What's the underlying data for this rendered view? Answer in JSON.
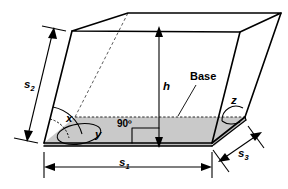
{
  "figure": {
    "labels": {
      "s1": {
        "text": "s",
        "sub": "1",
        "name": "base-length-label"
      },
      "s2": {
        "text": "s",
        "sub": "2",
        "name": "lateral-edge-label"
      },
      "s3": {
        "text": "s",
        "sub": "3",
        "name": "base-depth-label"
      },
      "h": {
        "text": "h",
        "name": "height-label"
      },
      "x": {
        "text": "x",
        "name": "angle-x-label"
      },
      "y": {
        "text": "y",
        "name": "angle-y-label"
      },
      "z": {
        "text": "z",
        "name": "angle-z-label"
      },
      "right_angle": {
        "text": "90º",
        "name": "right-angle-label"
      },
      "base": {
        "text": "Base",
        "name": "base-label"
      }
    },
    "colors": {
      "stroke": "#000000",
      "base_fill": "#c9c9c9",
      "side_fill": "#bdbdbd",
      "hidden_edge": "#4a4a4a",
      "background": "#ffffff"
    }
  }
}
